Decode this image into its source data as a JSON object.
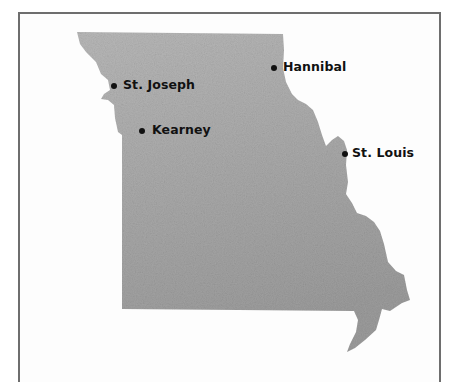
{
  "map": {
    "region": "Missouri",
    "fill_color": "#a9a9a9",
    "border_color": "#6e6e6e",
    "marker_color": "#111111",
    "cities": [
      {
        "name": "St. Joseph",
        "dot_x": 114,
        "dot_y": 86,
        "label_x": 123,
        "label_y": 79
      },
      {
        "name": "Hannibal",
        "dot_x": 274,
        "dot_y": 68,
        "label_x": 284,
        "label_y": 61
      },
      {
        "name": "Kearney",
        "dot_x": 142,
        "dot_y": 131,
        "label_x": 152,
        "label_y": 124
      },
      {
        "name": "St. Louis",
        "dot_x": 345,
        "dot_y": 154,
        "label_x": 352,
        "label_y": 147
      }
    ]
  }
}
